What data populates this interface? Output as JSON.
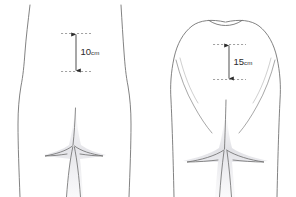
{
  "figure": {
    "background_color": "#ffffff",
    "outline_color": "#6b6b6b",
    "shade_color": "#e9e9ec",
    "dimension_color": "#2b2b2b",
    "dashed_color": "#8a8a8a",
    "width": 296,
    "height": 197
  },
  "panels": [
    {
      "id": "left-panel",
      "name": "slim-figure",
      "measurement": {
        "value": "10",
        "unit": "cm",
        "full_label": "10cm",
        "orientation": "vertical",
        "top_y": 33,
        "bottom_y": 72
      }
    },
    {
      "id": "right-panel",
      "name": "full-figure",
      "measurement": {
        "value": "15",
        "unit": "cm",
        "full_label": "15cm",
        "orientation": "vertical",
        "top_y": 44,
        "bottom_y": 80
      }
    }
  ]
}
